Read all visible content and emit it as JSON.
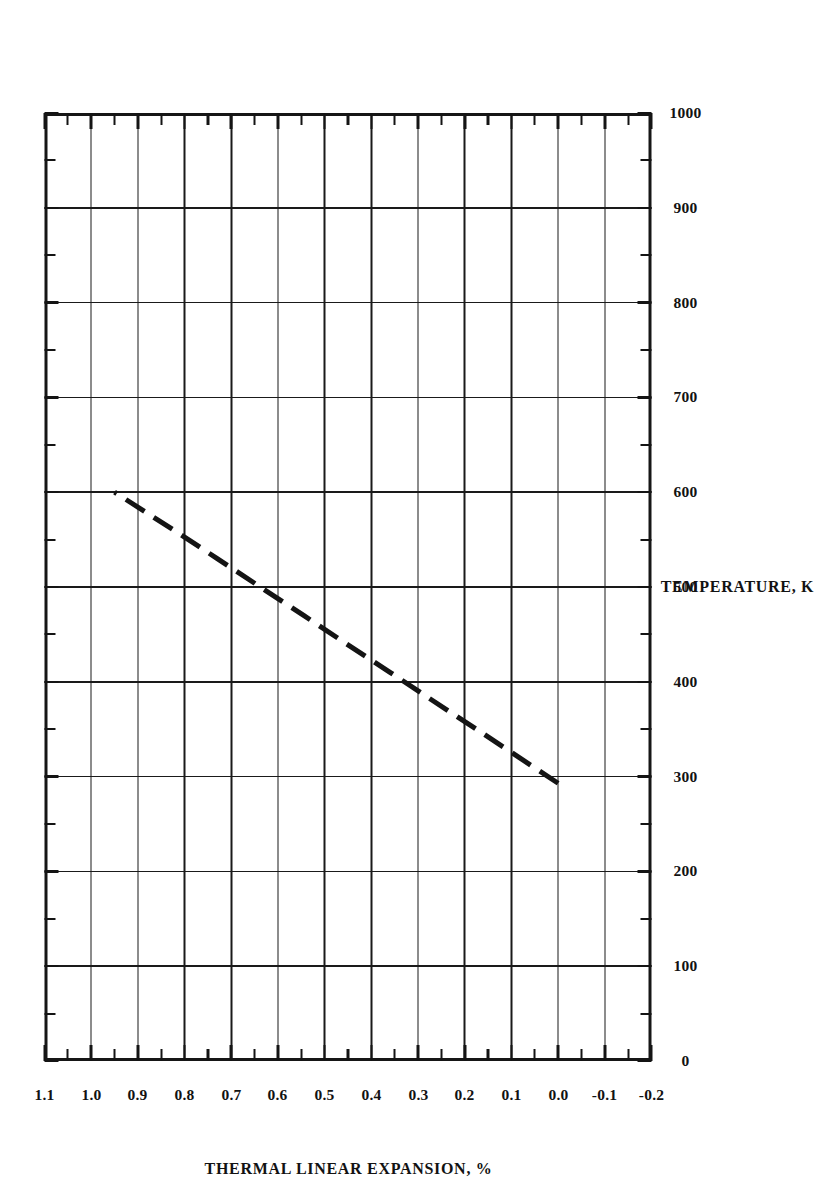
{
  "chart_data": {
    "type": "line",
    "title": "",
    "xlabel": "TEMPERATURE, K",
    "ylabel": "THERMAL LINEAR EXPANSION, %",
    "xlim": [
      0,
      1000
    ],
    "ylim": [
      -0.2,
      1.1
    ],
    "x_major_step": 100,
    "x_minor_step": 50,
    "y_major_step": 0.1,
    "y_minor_step": 0.05,
    "grid": true,
    "legend": "none",
    "orientation": "page rotated 90 degrees (landscape figure on portrait page)",
    "xticks": [
      0,
      100,
      200,
      300,
      400,
      500,
      600,
      700,
      800,
      900,
      1000
    ],
    "xtick_labels": [
      "0",
      "100",
      "200",
      "300",
      "400",
      "500",
      "600",
      "700",
      "800",
      "900",
      "1000"
    ],
    "yticks": [
      1.1,
      1.0,
      0.9,
      0.8,
      0.7,
      0.6,
      0.5,
      0.4,
      0.3,
      0.2,
      0.1,
      0.0,
      -0.1,
      -0.2
    ],
    "ytick_labels": [
      "1.1",
      "1.0",
      "0.9",
      "0.8",
      "0.7",
      "0.6",
      "0.5",
      "0.4",
      "0.3",
      "0.2",
      "0.1",
      "0.0",
      "-0.1",
      "-0.2"
    ],
    "series": [
      {
        "name": "thermal linear expansion",
        "style": "dashed",
        "color": "#141414",
        "linewidth": 5,
        "x": [
          293,
          320,
          350,
          380,
          410,
          440,
          470,
          500,
          530,
          560,
          600
        ],
        "y": [
          0.0,
          0.083,
          0.175,
          0.268,
          0.36,
          0.453,
          0.545,
          0.638,
          0.73,
          0.823,
          0.95
        ],
        "endpoints": [
          {
            "x": 293,
            "y": 0.0
          },
          {
            "x": 600,
            "y": 0.95
          }
        ]
      }
    ]
  },
  "axes": {
    "x_title": "TEMPERATURE, K",
    "y_title": "THERMAL LINEAR EXPANSION, %"
  }
}
